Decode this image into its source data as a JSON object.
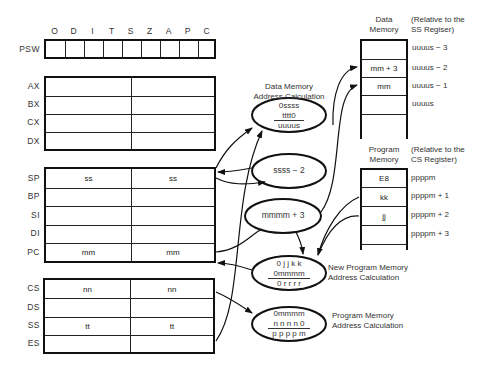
{
  "psw": {
    "label": "PSW",
    "flags": [
      "O",
      "D",
      "I",
      "T",
      "S",
      "Z",
      "A",
      "P",
      "C"
    ]
  },
  "general_registers": [
    {
      "name": "AX",
      "high": "",
      "low": ""
    },
    {
      "name": "BX",
      "high": "",
      "low": ""
    },
    {
      "name": "CX",
      "high": "",
      "low": ""
    },
    {
      "name": "DX",
      "high": "",
      "low": ""
    }
  ],
  "pointer_registers": [
    {
      "name": "SP",
      "high": "ss",
      "low": "ss"
    },
    {
      "name": "BP",
      "high": "",
      "low": ""
    },
    {
      "name": "SI",
      "high": "",
      "low": ""
    },
    {
      "name": "DI",
      "high": "",
      "low": ""
    },
    {
      "name": "PC",
      "high": "mm",
      "low": "mm"
    }
  ],
  "segment_registers": [
    {
      "name": "CS",
      "high": "nn",
      "low": "nn"
    },
    {
      "name": "DS",
      "high": "",
      "low": ""
    },
    {
      "name": "SS",
      "high": "tt",
      "low": "tt"
    },
    {
      "name": "ES",
      "high": "",
      "low": ""
    }
  ],
  "data_memory": {
    "title_line1": "Data",
    "title_line2": "Memory",
    "note_line1": "(Relative to the",
    "note_line2": "SS Regiser)",
    "cells": [
      {
        "value": "",
        "address": "uuuus − 3"
      },
      {
        "value": "mm + 3",
        "address": "uuuus − 2"
      },
      {
        "value": "mm",
        "address": "uuuus − 1"
      },
      {
        "value": "",
        "address": "uuuus"
      },
      {
        "value": "",
        "address": ""
      }
    ]
  },
  "program_memory": {
    "title_line1": "Program",
    "title_line2": "Memory",
    "note_line1": "(Relative to the",
    "note_line2": "CS Register)",
    "cells": [
      {
        "value": "E8",
        "address": "ppppm"
      },
      {
        "value": "kk",
        "address": "ppppm + 1"
      },
      {
        "value": "jj",
        "address": "ppppm + 2"
      },
      {
        "value": "",
        "address": "ppppm + 3"
      }
    ]
  },
  "calculations": {
    "data_addr": {
      "title_line1": "Data Memory",
      "title_line2": "Address Calculation",
      "line1": "0ssss",
      "line2": "tttt0",
      "line3": "uuuus"
    },
    "stack_decrement": {
      "text": "ssss − 2"
    },
    "return_addr": {
      "text": "mmmm + 3"
    },
    "new_prog_addr": {
      "label_line1": "New Program Memory",
      "label_line2": "Address Calculation",
      "line1": "0 j j k k",
      "line2": "0mmmm",
      "line3": "0 r r r r"
    },
    "prog_addr": {
      "label_line1": "Program Memory",
      "label_line2": "Address Calculation",
      "line1": "0mmmm",
      "line2": "n n n n 0",
      "line3": "p p p p m"
    }
  }
}
